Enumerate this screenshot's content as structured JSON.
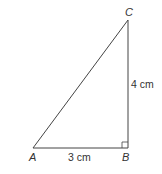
{
  "diagram": {
    "type": "right-triangle",
    "vertices": {
      "A": {
        "label": "A",
        "x": 33,
        "y": 148
      },
      "B": {
        "label": "B",
        "x": 128,
        "y": 148
      },
      "C": {
        "label": "C",
        "x": 128,
        "y": 20
      }
    },
    "sides": {
      "AB": {
        "label": "3 cm"
      },
      "BC": {
        "label": "4 cm"
      }
    },
    "right_angle_at": "B",
    "stroke_color": "#444444",
    "text_color": "#333333"
  }
}
